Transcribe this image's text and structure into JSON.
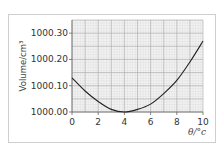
{
  "chart_data": {
    "type": "line",
    "title": "",
    "xlabel": "θ/°c",
    "ylabel": "Volume/cm³",
    "x_ticks": [
      "0",
      "2",
      "4",
      "6",
      "8",
      "10"
    ],
    "y_ticks": [
      "1000.00",
      "1000.10",
      "1000.20",
      "1000.30"
    ],
    "xlim": [
      0,
      10
    ],
    "ylim": [
      1000.0,
      1000.35
    ],
    "grid": true,
    "legend": null,
    "series": [
      {
        "name": "Volume of water",
        "color": "#222222",
        "x": [
          0,
          1,
          2,
          3,
          4,
          5,
          6,
          7,
          8,
          9,
          10
        ],
        "y": [
          1000.13,
          1000.08,
          1000.04,
          1000.01,
          1000.0,
          1000.01,
          1000.03,
          1000.07,
          1000.12,
          1000.19,
          1000.27
        ]
      }
    ]
  },
  "labels": {
    "ylabel": "Volume/cm³",
    "xlabel": "θ/°c",
    "yticks": [
      "1000.30",
      "1000.20",
      "1000.10",
      "1000.00"
    ],
    "xticks": [
      "0",
      "2",
      "4",
      "6",
      "8",
      "10"
    ]
  }
}
